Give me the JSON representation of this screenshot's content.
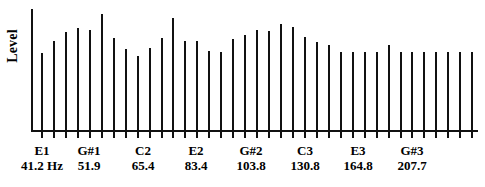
{
  "figure": {
    "y_axis_title": "Level",
    "background_color": "#ffffff",
    "ink_color": "#111111"
  },
  "chart_data": {
    "type": "bar",
    "title": "",
    "xlabel": "",
    "ylabel": "Level",
    "grid": false,
    "legend": null,
    "axis_note": "Y axis is unlabeled (relative level). X axis is semitone pitch with note name and fundamental frequency in Hz.",
    "x_tick_labels": [
      {
        "note": "E1",
        "freq": "41.2 Hz",
        "x": 42
      },
      {
        "note": "G#1",
        "freq": "51.9",
        "x": 89
      },
      {
        "note": "C2",
        "freq": "65.4",
        "x": 143
      },
      {
        "note": "E2",
        "freq": "83.4",
        "x": 196
      },
      {
        "note": "G#2",
        "freq": "103.8",
        "x": 251
      },
      {
        "note": "C3",
        "freq": "130.8",
        "x": 305
      },
      {
        "note": "E3",
        "freq": "164.8",
        "x": 358
      },
      {
        "note": "G#3",
        "freq": "207.7",
        "x": 412
      }
    ],
    "categories": [
      "E1",
      "F1",
      "F#1",
      "G1",
      "G#1",
      "A1",
      "A#1",
      "B1",
      "C2",
      "C#2",
      "D2",
      "D#2",
      "E2",
      "F2",
      "F#2",
      "G2",
      "G#2",
      "A2",
      "A#2",
      "B2",
      "C3",
      "C#3",
      "D3",
      "D#3",
      "E3",
      "F3",
      "F#3",
      "G3",
      "G#3",
      "A3",
      "A#3",
      "B3",
      "C4",
      "C#4",
      "D4",
      "D#4",
      "E4"
    ],
    "values": [
      0.66,
      0.77,
      0.84,
      0.88,
      0.86,
      1.0,
      0.79,
      0.7,
      0.64,
      0.71,
      0.79,
      0.96,
      0.77,
      0.77,
      0.68,
      0.67,
      0.78,
      0.82,
      0.86,
      0.85,
      0.91,
      0.89,
      0.8,
      0.76,
      0.73,
      0.67,
      0.67,
      0.67,
      0.67,
      0.73,
      0.67,
      0.67,
      0.67,
      0.67,
      0.67,
      0.67,
      0.67
    ],
    "ylim": [
      0,
      1.05
    ]
  }
}
